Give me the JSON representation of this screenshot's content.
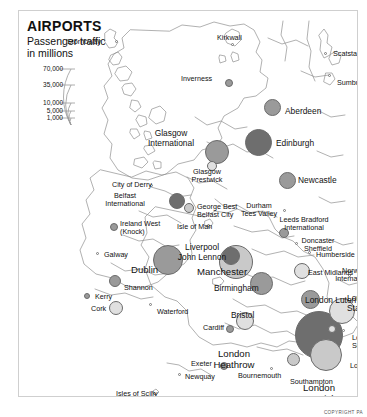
{
  "header": {
    "title": "AIRPORTS",
    "subtitle": "Passenger traffic\nin millions"
  },
  "legend": {
    "labels": [
      "70,000",
      "35,000",
      "10,000",
      "5,000",
      "1,000"
    ],
    "unit_note": "in millions"
  },
  "footer": {
    "copyright": "COPYRIGHT PA"
  },
  "colors": {
    "dark": "#6e6e6e",
    "mid": "#9a9a9a",
    "light": "#c9c9c9",
    "pale": "#e0e0e0",
    "coast": "#8c8c8c",
    "text": "#111111"
  },
  "chart_data": {
    "type": "scatter",
    "title": "AIRPORTS",
    "subtitle": "Passenger traffic in millions",
    "legend_breaks": [
      70000,
      35000,
      10000,
      5000,
      1000
    ],
    "points": [
      {
        "name": "Stornoway",
        "x": 98,
        "y": 31,
        "r": 2.5,
        "shade": "tick",
        "label_x": 48,
        "label_y": 27,
        "align": "left"
      },
      {
        "name": "Kirkwall",
        "x": 214,
        "y": 34,
        "r": 3.0,
        "shade": "tick",
        "label_x": 198,
        "label_y": 23,
        "align": "left"
      },
      {
        "name": "Scatsta",
        "x": 307,
        "y": 43,
        "r": 2.5,
        "shade": "tick",
        "label_x": 314,
        "label_y": 39,
        "align": "left"
      },
      {
        "name": "Sumburgh",
        "x": 311,
        "y": 65,
        "r": 2.5,
        "shade": "tick",
        "label_x": 318,
        "label_y": 68,
        "align": "left"
      },
      {
        "name": "Inverness",
        "x": 210,
        "y": 72,
        "r": 4.0,
        "shade": "mid",
        "label_x": 162,
        "label_y": 64,
        "align": "left"
      },
      {
        "name": "Aberdeen",
        "x": 253,
        "y": 96,
        "r": 8.5,
        "shade": "mid",
        "label_x": 266,
        "label_y": 96,
        "align": "left"
      },
      {
        "name": "Glasgow International",
        "x": 198,
        "y": 141,
        "r": 12.0,
        "shade": "mid",
        "label_x": 152,
        "label_y": 118,
        "align": "center"
      },
      {
        "name": "Glasgow Prestwick",
        "x": 193,
        "y": 155,
        "r": 5.0,
        "shade": "pale",
        "label_x": 188,
        "label_y": 157,
        "align": "center"
      },
      {
        "name": "Edinburgh",
        "x": 239,
        "y": 131,
        "r": 13.5,
        "shade": "dark",
        "label_x": 257,
        "label_y": 128,
        "align": "left"
      },
      {
        "name": "Newcastle",
        "x": 268,
        "y": 169,
        "r": 8.5,
        "shade": "mid",
        "label_x": 279,
        "label_y": 165,
        "align": "left"
      },
      {
        "name": "City of Derry",
        "x": 133,
        "y": 175,
        "r": 2.8,
        "shade": "tick",
        "label_x": 93,
        "label_y": 170,
        "align": "left"
      },
      {
        "name": "Belfast International",
        "x": 158,
        "y": 190,
        "r": 8.0,
        "shade": "dark",
        "label_x": 106,
        "label_y": 181,
        "align": "center"
      },
      {
        "name": "George Best Belfast City",
        "x": 170,
        "y": 197,
        "r": 5.0,
        "shade": "light",
        "label_x": 178,
        "label_y": 192,
        "align": "left"
      },
      {
        "name": "Ireland West (Knock)",
        "x": 95,
        "y": 216,
        "r": 4.0,
        "shade": "mid",
        "label_x": 101,
        "label_y": 209,
        "align": "left"
      },
      {
        "name": "Galway",
        "x": 79,
        "y": 243,
        "r": 2.5,
        "shade": "tick",
        "label_x": 85,
        "label_y": 240,
        "align": "left"
      },
      {
        "name": "Isle of Man",
        "x": 190,
        "y": 215,
        "r": 3.2,
        "shade": "tick",
        "label_x": 158,
        "label_y": 212,
        "align": "left"
      },
      {
        "name": "Dublin",
        "x": 149,
        "y": 249,
        "r": 15.0,
        "shade": "mid",
        "label_x": 112,
        "label_y": 254,
        "align": "left"
      },
      {
        "name": "Shannon",
        "x": 96,
        "y": 270,
        "r": 6.0,
        "shade": "mid",
        "label_x": 105,
        "label_y": 273,
        "align": "left"
      },
      {
        "name": "Kerry",
        "x": 68,
        "y": 285,
        "r": 3.2,
        "shade": "mid",
        "label_x": 76,
        "label_y": 282,
        "align": "left"
      },
      {
        "name": "Cork",
        "x": 97,
        "y": 297,
        "r": 7.0,
        "shade": "pale",
        "label_x": 72,
        "label_y": 294,
        "align": "left"
      },
      {
        "name": "Waterford",
        "x": 132,
        "y": 294,
        "r": 2.5,
        "shade": "tick",
        "label_x": 138,
        "label_y": 297,
        "align": "left"
      },
      {
        "name": "Durham Tees Valley",
        "x": 266,
        "y": 200,
        "r": 2.8,
        "shade": "tick",
        "label_x": 240,
        "label_y": 191,
        "align": "center"
      },
      {
        "name": "Leeds Bradford International",
        "x": 265,
        "y": 222,
        "r": 5.0,
        "shade": "mid",
        "label_x": 285,
        "label_y": 205,
        "align": "center"
      },
      {
        "name": "Doncaster Sheffield",
        "x": 278,
        "y": 233,
        "r": 3.0,
        "shade": "tick",
        "label_x": 299,
        "label_y": 226,
        "align": "center"
      },
      {
        "name": "Humberside",
        "x": 291,
        "y": 242,
        "r": 2.5,
        "shade": "tick",
        "label_x": 297,
        "label_y": 240,
        "align": "left"
      },
      {
        "name": "Liverpool John Lennon",
        "x": 212,
        "y": 245,
        "r": 9.0,
        "shade": "dark",
        "label_x": 183,
        "label_y": 232,
        "align": "center"
      },
      {
        "name": "Manchester",
        "x": 217,
        "y": 251,
        "r": 17.0,
        "shade": "light",
        "label_x": 178,
        "label_y": 256,
        "align": "left"
      },
      {
        "name": "East Midlands",
        "x": 283,
        "y": 260,
        "r": 8.0,
        "shade": "pale",
        "label_x": 289,
        "label_y": 258,
        "align": "left"
      },
      {
        "name": "Birmingham",
        "x": 242,
        "y": 272,
        "r": 11.5,
        "shade": "mid",
        "label_x": 195,
        "label_y": 273,
        "align": "left"
      },
      {
        "name": "Norwich International",
        "x": 331,
        "y": 265,
        "r": 3.0,
        "shade": "tick",
        "label_x": 336,
        "label_y": 256,
        "align": "center"
      },
      {
        "name": "London Luton",
        "x": 291,
        "y": 288,
        "r": 9.5,
        "shade": "mid",
        "label_x": 286,
        "label_y": 285,
        "align": "left"
      },
      {
        "name": "London Stansted",
        "x": 323,
        "y": 300,
        "r": 13.0,
        "shade": "pale",
        "label_x": 328,
        "label_y": 283,
        "align": "left"
      },
      {
        "name": "London Heathrow",
        "x": 300,
        "y": 324,
        "r": 24.0,
        "shade": "dark",
        "label_x": 215,
        "label_y": 338,
        "align": "center"
      },
      {
        "name": "London City",
        "x": 313,
        "y": 318,
        "r": 4.0,
        "shade": "pale",
        "label_x": 331,
        "label_y": 351,
        "align": "left"
      },
      {
        "name": "London Southend",
        "x": 325,
        "y": 320,
        "r": 3.0,
        "shade": "tick",
        "label_x": 333,
        "label_y": 323,
        "align": "left"
      },
      {
        "name": "London Gatwick",
        "x": 307,
        "y": 344,
        "r": 16.0,
        "shade": "light",
        "label_x": 300,
        "label_y": 372,
        "align": "center"
      },
      {
        "name": "Bristol",
        "x": 226,
        "y": 310,
        "r": 9.0,
        "shade": "pale",
        "label_x": 212,
        "label_y": 300,
        "align": "left"
      },
      {
        "name": "Cardiff",
        "x": 211,
        "y": 318,
        "r": 4.0,
        "shade": "mid",
        "label_x": 184,
        "label_y": 313,
        "align": "left"
      },
      {
        "name": "Southampton",
        "x": 274,
        "y": 348,
        "r": 6.5,
        "shade": "light",
        "label_x": 271,
        "label_y": 367,
        "align": "left"
      },
      {
        "name": "Bournemouth",
        "x": 253,
        "y": 358,
        "r": 3.2,
        "shade": "tick",
        "label_x": 219,
        "label_y": 361,
        "align": "left"
      },
      {
        "name": "Exeter",
        "x": 205,
        "y": 355,
        "r": 4.0,
        "shade": "mid",
        "label_x": 172,
        "label_y": 349,
        "align": "left"
      },
      {
        "name": "Newquay",
        "x": 161,
        "y": 364,
        "r": 2.5,
        "shade": "tick",
        "label_x": 166,
        "label_y": 362,
        "align": "left"
      },
      {
        "name": "Isles of Scilly",
        "x": 136,
        "y": 383,
        "r": 2.5,
        "shade": "tick",
        "label_x": 97,
        "label_y": 379,
        "align": "left"
      }
    ]
  }
}
